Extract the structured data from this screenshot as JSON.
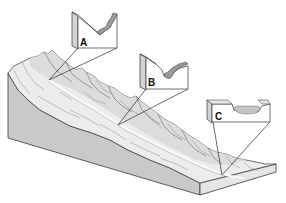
{
  "diagram": {
    "colors": {
      "background": "#ffffff",
      "block_side": "#c9c9c9",
      "block_end": "#e2e2e2",
      "terrain_top": "#ececec",
      "river": "#f8f8f8",
      "section_face": "#ffffff",
      "section_side": "#d4d4d4",
      "section_fill": "#9a9a9a",
      "line": "#333333"
    },
    "callouts": [
      {
        "id": "A",
        "label": "A",
        "profile": "narrow V-shaped valley"
      },
      {
        "id": "B",
        "label": "B",
        "profile": "valley with small channel"
      },
      {
        "id": "C",
        "label": "C",
        "profile": "broad flat valley floor"
      }
    ]
  }
}
